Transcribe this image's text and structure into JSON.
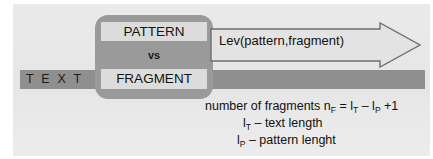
{
  "diagram": {
    "text_bar": {
      "label": "T E X T",
      "color": "#8f8f8f"
    },
    "comparison_box": {
      "pattern_label": "PATTERN",
      "vs_label": "vs",
      "fragment_label": "FRAGMENT",
      "box_color": "#9a9a9a",
      "chip_color": "#dcdcdc"
    },
    "arrow": {
      "label": "Lev(pattern,fragment)",
      "fill": "#e3e3e3",
      "stroke": "#6b6b6b"
    },
    "formula": {
      "line1_a": "number of fragments n",
      "line1_sub1": "F",
      "line1_b": " = l",
      "line1_sub2": "T",
      "line1_c": " – l",
      "line1_sub3": "P",
      "line1_d": " +1",
      "line2_a": "l",
      "line2_sub": "T",
      "line2_b": " – text length",
      "line3_a": "l",
      "line3_sub": "P",
      "line3_b": " – pattern lenght"
    }
  }
}
